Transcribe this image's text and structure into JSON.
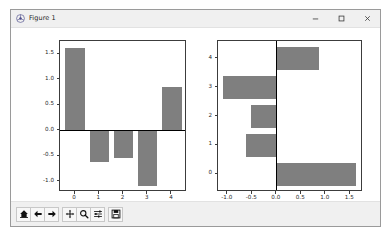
{
  "window": {
    "title": "Figure 1",
    "icon": "matplotlib-logo-icon",
    "controls": {
      "minimize_label": "–",
      "maximize_label": "□",
      "close_label": "✕"
    }
  },
  "toolbar": {
    "buttons": [
      {
        "name": "home-icon",
        "tooltip": "Home"
      },
      {
        "name": "back-arrow-icon",
        "tooltip": "Back"
      },
      {
        "name": "forward-arrow-icon",
        "tooltip": "Forward"
      },
      {
        "name": "pan-move-icon",
        "tooltip": "Pan"
      },
      {
        "name": "zoom-magnifier-icon",
        "tooltip": "Zoom to rectangle"
      },
      {
        "name": "subplot-sliders-icon",
        "tooltip": "Configure subplots"
      },
      {
        "name": "save-floppy-icon",
        "tooltip": "Save the figure"
      }
    ]
  },
  "colors": {
    "bar": "#7f7f7f",
    "axis": "#3c3c3c",
    "zero_line": "#000000",
    "figure_background": "#ffffff",
    "window_background": "#f0f0f0"
  },
  "chart_data": [
    {
      "type": "bar",
      "orientation": "vertical",
      "title": "",
      "xlabel": "",
      "ylabel": "",
      "categories": [
        "0",
        "1",
        "2",
        "3",
        "4"
      ],
      "x": [
        0,
        1,
        2,
        3,
        4
      ],
      "values": [
        1.62,
        -0.62,
        -0.53,
        -1.09,
        0.86
      ],
      "xticks": [
        "0",
        "1",
        "2",
        "3",
        "4"
      ],
      "yticks": [
        "1.5",
        "1.0",
        "0.5",
        "0.0",
        "-0.5",
        "-1.0"
      ],
      "ytick_values": [
        1.5,
        1.0,
        0.5,
        0.0,
        -0.5,
        -1.0
      ],
      "xlim": [
        -0.62,
        4.62
      ],
      "ylim": [
        -1.2,
        1.76
      ],
      "grid": false,
      "legend": null,
      "bar_color": "#7f7f7f",
      "zero_line": true
    },
    {
      "type": "bar",
      "orientation": "horizontal",
      "title": "",
      "xlabel": "",
      "ylabel": "",
      "categories": [
        "0",
        "1",
        "2",
        "3",
        "4"
      ],
      "y": [
        0,
        1,
        2,
        3,
        4
      ],
      "values": [
        1.62,
        -0.62,
        -0.53,
        -1.09,
        0.86
      ],
      "xticks": [
        "-1.0",
        "-0.5",
        "0.0",
        "0.5",
        "1.0",
        "1.5"
      ],
      "xtick_values": [
        -1.0,
        -0.5,
        0.0,
        0.5,
        1.0,
        1.5
      ],
      "yticks": [
        "0",
        "1",
        "2",
        "3",
        "4"
      ],
      "ytick_values": [
        0,
        1,
        2,
        3,
        4
      ],
      "xlim": [
        -1.2,
        1.76
      ],
      "ylim": [
        -0.62,
        4.62
      ],
      "grid": false,
      "legend": null,
      "bar_color": "#7f7f7f",
      "zero_line": true
    }
  ]
}
